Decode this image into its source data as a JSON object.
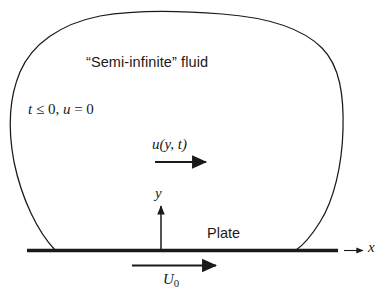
{
  "figure": {
    "background_color": "#ffffff",
    "line_color": "#1a1a1a",
    "labels": {
      "fluid_region": "“Semi-infinite” fluid",
      "initial_condition_t": "t",
      "initial_condition_rest": " ≤ 0, ",
      "initial_condition_u": "u",
      "initial_condition_eq": " = 0",
      "initial_condition_full": "t ≤ 0, u = 0",
      "velocity_function_u": "u",
      "velocity_function_args": "(y, t)",
      "velocity_function_full": "u(y, t)",
      "y_axis": "y",
      "x_axis": "x",
      "plate": "Plate",
      "plate_velocity_symbol": "U",
      "plate_velocity_subscript": "0",
      "plate_velocity_full": "U0"
    },
    "geometry": {
      "plate_line": {
        "x1": 27,
        "y1": 250,
        "x2": 338,
        "y2": 250,
        "thickness": 3.2
      },
      "x_axis_arrow": {
        "x1": 344,
        "y1": 250,
        "x2": 364,
        "y2": 250
      },
      "y_axis_arrow": {
        "x1": 161,
        "y1": 250,
        "x2": 161,
        "y2": 205
      },
      "u_profile_arrow": {
        "x1": 155,
        "y1": 162,
        "x2": 207,
        "y2": 162
      },
      "plate_velocity_arrow": {
        "x1": 132,
        "y1": 265,
        "x2": 217,
        "y2": 265
      },
      "fluid_blob_left_foot_x": 55,
      "fluid_blob_right_foot_x": 296,
      "fluid_blob_top_y": 13
    }
  }
}
